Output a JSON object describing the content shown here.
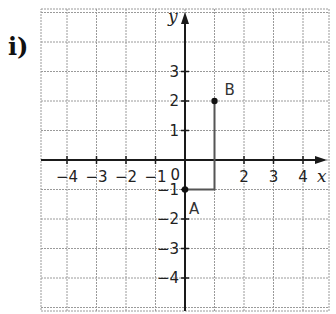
{
  "problem_label": "i)",
  "axes": {
    "x_label": "x",
    "y_label": "y",
    "origin_label": "0",
    "x_ticks": [
      "−4",
      "−3",
      "−2",
      "−1",
      "2",
      "3",
      "4"
    ],
    "y_ticks": [
      "3",
      "2",
      "1",
      "−1",
      "−2",
      "−3",
      "−4"
    ]
  },
  "points": [
    {
      "name": "A",
      "x": 0,
      "y": -1,
      "label": "A"
    },
    {
      "name": "B",
      "x": 1,
      "y": 2,
      "label": "B"
    }
  ],
  "path": [
    {
      "x": 0,
      "y": -1
    },
    {
      "x": 1,
      "y": -1
    },
    {
      "x": 1,
      "y": 2
    }
  ],
  "colors": {
    "grid": "#9a9a9a",
    "axis": "#1a1a1a",
    "path": "#555555"
  }
}
